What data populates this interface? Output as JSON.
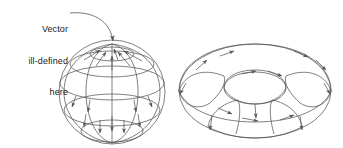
{
  "figure": {
    "background_color": "#ffffff",
    "stroke_color": "#555555",
    "text_color": "#1a1a1a",
    "width": 343,
    "height": 148
  },
  "annotation": {
    "name": "vector-ill-defined-callout",
    "line1": "Vector",
    "line2": "ill-defined",
    "line3": "here",
    "leader": {
      "description": "curved leader line with arrowhead",
      "from_x": 70,
      "from_y": 14,
      "to_x": 113,
      "to_y": 46
    }
  },
  "sphere": {
    "name": "sphere-vector-field",
    "center_x": 112,
    "center_y": 92,
    "radius_x": 53,
    "radius_y": 52,
    "pole_x": 112,
    "pole_y": 44,
    "latitudes": [
      {
        "label": "polar-cap",
        "cy": 54,
        "rx": 22,
        "ry": 7
      },
      {
        "label": "upper-mid",
        "cy": 64,
        "rx": 42,
        "ry": 13
      },
      {
        "label": "equator",
        "cy": 83,
        "rx": 52,
        "ry": 17
      },
      {
        "label": "lower-mid",
        "cy": 110,
        "rx": 48,
        "ry": 16
      },
      {
        "label": "south-cap",
        "cy": 131,
        "rx": 31,
        "ry": 11
      }
    ],
    "meridian_count": 6,
    "arrow_count": 14,
    "arrow_direction": "toward-north-pole-then-down-meridians"
  },
  "torus": {
    "name": "torus-vector-field",
    "center_x": 255,
    "center_y": 91,
    "outer_rx": 76,
    "outer_ry": 48,
    "inner_rx": 30,
    "inner_ry": 16,
    "tube_count": 4,
    "arrow_count": 12,
    "arrow_direction": "along-toroidal-and-poloidal-loops"
  }
}
